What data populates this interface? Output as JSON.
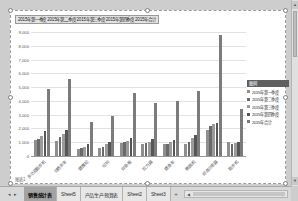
{
  "chart": {
    "title": "2015年第一季度 2015年第二季度 2015年第三季度 2015年第四季度 2015年合计",
    "corner_label": "图表1",
    "legend": {
      "header": "图例",
      "position": "right"
    },
    "y_axis": {
      "ticks": [
        "9,000",
        "8,000",
        "7,000",
        "6,000",
        "5,000",
        "4,000",
        "3,000",
        "2,000",
        "1,000",
        "0"
      ]
    }
  },
  "chart_data": {
    "type": "bar",
    "title": "2015年第一季度 2015年第二季度 2015年第三季度 2015年第四季度 2015年合计",
    "categories": [
      "多功能跑步机",
      "动感单车",
      "健腹轮",
      "哑铃",
      "仰卧板",
      "拉力器",
      "健身车",
      "椭圆机",
      "综合训练器",
      "跑步机"
    ],
    "series": [
      {
        "name": "2015年第一季度",
        "color": "#8f8f8f",
        "values": [
          1150,
          1100,
          520,
          550,
          950,
          880,
          860,
          900,
          1900,
          1000
        ]
      },
      {
        "name": "2015年第二季度",
        "color": "#6a6a6a",
        "values": [
          1250,
          1400,
          570,
          640,
          1000,
          930,
          900,
          1050,
          2150,
          840
        ]
      },
      {
        "name": "2015年第三季度",
        "color": "#9b9b9b",
        "values": [
          1450,
          1580,
          690,
          880,
          1120,
          1050,
          1050,
          1290,
          2340,
          910
        ]
      },
      {
        "name": "2015年第四季度",
        "color": "#565656",
        "values": [
          1780,
          1870,
          880,
          1050,
          1340,
          1240,
          1180,
          1550,
          2400,
          1030
        ]
      },
      {
        "name": "2015年合计",
        "color": "#7c7c7c",
        "values": [
          4870,
          5600,
          2450,
          2900,
          4550,
          3880,
          4000,
          4730,
          8790,
          3380
        ]
      }
    ],
    "xlabel": "",
    "ylabel": "",
    "ylim": [
      0,
      9000
    ],
    "ytick_step": 1000,
    "grid": true,
    "legend_position": "right"
  },
  "tabbar": {
    "nav_left_icon": "◂",
    "nav_right_icon": "▸",
    "tabs": [
      {
        "label": "销售统计表",
        "active": true
      },
      {
        "label": "Sheet5",
        "active": false
      },
      {
        "label": "产品生产预算表",
        "active": false
      },
      {
        "label": "Sheet2",
        "active": false
      },
      {
        "label": "Sheet3",
        "active": false
      }
    ],
    "new_sheet_icon": "+"
  },
  "scrollbars": {
    "h_left_icon": "◀",
    "h_right_icon": "▶",
    "v_up_icon": "▲",
    "v_down_icon": "▼"
  }
}
